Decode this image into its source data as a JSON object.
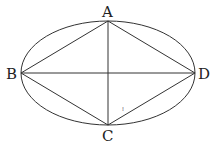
{
  "diagram": {
    "type": "geometry",
    "ellipse": {
      "cx": 108,
      "cy": 73,
      "rx": 87,
      "ry": 52,
      "stroke": "#333333"
    },
    "points": {
      "A": {
        "label": "A",
        "x": 108,
        "y": 21
      },
      "B": {
        "label": "B",
        "x": 21,
        "y": 73
      },
      "C": {
        "label": "C",
        "x": 108,
        "y": 125
      },
      "D": {
        "label": "D",
        "x": 195,
        "y": 73
      }
    },
    "segments": [
      "AB",
      "BC",
      "CD",
      "DA",
      "AC",
      "BD"
    ],
    "annotation": {
      "text": "⁞",
      "x": 123,
      "y": 110
    },
    "line_color": "#333333"
  }
}
